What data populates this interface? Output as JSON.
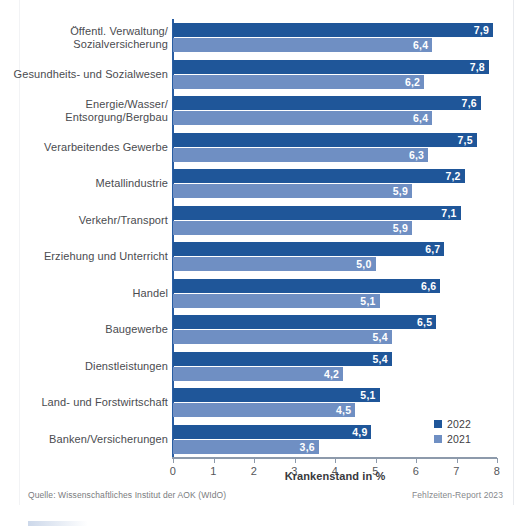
{
  "chart_data": {
    "type": "bar",
    "orientation": "horizontal",
    "title": "",
    "xlabel": "Krankenstand in %",
    "ylabel": "",
    "xlim": [
      0,
      8
    ],
    "xticks": [
      "0",
      "1",
      "2",
      "3",
      "4",
      "5",
      "6",
      "7",
      "8"
    ],
    "grid": false,
    "legend_position": "bottom-right",
    "categories": [
      "Öffentl. Verwaltung/ Sozialversicherung",
      "Gesundheits- und Sozialwesen",
      "Energie/Wasser/ Entsorgung/Bergbau",
      "Verarbeitendes Gewerbe",
      "Metallindustrie",
      "Verkehr/Transport",
      "Erziehung und Unterricht",
      "Handel",
      "Baugewerbe",
      "Dienstleistungen",
      "Land- und Forstwirtschaft",
      "Banken/Versicherungen"
    ],
    "category_lines": [
      [
        "Öffentl. Verwaltung/",
        "Sozialversicherung"
      ],
      [
        "Gesundheits- und Sozialwesen"
      ],
      [
        "Energie/Wasser/",
        "Entsorgung/Bergbau"
      ],
      [
        "Verarbeitendes Gewerbe"
      ],
      [
        "Metallindustrie"
      ],
      [
        "Verkehr/Transport"
      ],
      [
        "Erziehung und Unterricht"
      ],
      [
        "Handel"
      ],
      [
        "Baugewerbe"
      ],
      [
        "Dienstleistungen"
      ],
      [
        "Land- und Forstwirtschaft"
      ],
      [
        "Banken/Versicherungen"
      ]
    ],
    "series": [
      {
        "name": "2022",
        "color": "#1f5699",
        "values": [
          7.9,
          7.8,
          7.6,
          7.5,
          7.2,
          7.1,
          6.7,
          6.6,
          6.5,
          5.4,
          5.1,
          4.9
        ],
        "labels": [
          "7,9",
          "7,8",
          "7,6",
          "7,5",
          "7,2",
          "7,1",
          "6,7",
          "6,6",
          "6,5",
          "5,4",
          "5,1",
          "4,9"
        ]
      },
      {
        "name": "2021",
        "color": "#6f8fc3",
        "values": [
          6.4,
          6.2,
          6.4,
          6.3,
          5.9,
          5.9,
          5.0,
          5.1,
          5.4,
          4.2,
          4.5,
          3.6
        ],
        "labels": [
          "6,4",
          "6,2",
          "6,4",
          "6,3",
          "5,9",
          "5,9",
          "5,0",
          "5,1",
          "5,4",
          "4,2",
          "4,5",
          "3,6"
        ]
      }
    ]
  },
  "legend": {
    "items": [
      {
        "label": "2022",
        "color": "#1f5699"
      },
      {
        "label": "2021",
        "color": "#6f8fc3"
      }
    ]
  },
  "footer": {
    "source": "Quelle: Wissenschaftliches Institut der AOK (WIdO)",
    "report": "Fehlzeiten-Report 2023"
  }
}
